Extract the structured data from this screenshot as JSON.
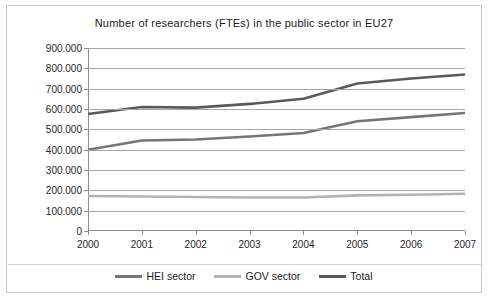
{
  "chart_data": {
    "type": "line",
    "title": "Number of researchers (FTEs) in the public sector in EU27",
    "xlabel": "",
    "ylabel": "",
    "categories": [
      "2000",
      "2001",
      "2002",
      "2003",
      "2004",
      "2005",
      "2006",
      "2007"
    ],
    "x": [
      2000,
      2001,
      2002,
      2003,
      2004,
      2005,
      2006,
      2007
    ],
    "ylim": [
      0,
      900000
    ],
    "ytick_step": 100000,
    "ytick_labels": [
      "900.000",
      "800.000",
      "700.000",
      "600.000",
      "500.000",
      "400.000",
      "300.000",
      "200.000",
      "100.000",
      "0"
    ],
    "ytick_values": [
      900000,
      800000,
      700000,
      600000,
      500000,
      400000,
      300000,
      200000,
      100000,
      0
    ],
    "grid": true,
    "legend_position": "bottom",
    "series": [
      {
        "name": "HEI sector",
        "color": "#767676",
        "values": [
          400000,
          445000,
          450000,
          465000,
          482000,
          540000,
          560000,
          580000
        ]
      },
      {
        "name": "GOV sector",
        "color": "#b3b3b3",
        "values": [
          172000,
          170000,
          167000,
          165000,
          165000,
          175000,
          178000,
          183000
        ]
      },
      {
        "name": "Total",
        "color": "#595959",
        "values": [
          575000,
          610000,
          607000,
          625000,
          650000,
          725000,
          750000,
          770000
        ]
      }
    ]
  },
  "legend": {
    "items": [
      {
        "label": "HEI sector",
        "color": "#767676"
      },
      {
        "label": "GOV sector",
        "color": "#b3b3b3"
      },
      {
        "label": "Total",
        "color": "#595959"
      }
    ]
  },
  "colors": {
    "frame_border": "#c9c9c9",
    "gridline": "#a6a6a6",
    "axis": "#8c8c8c",
    "text": "#262626",
    "background": "#ffffff"
  }
}
